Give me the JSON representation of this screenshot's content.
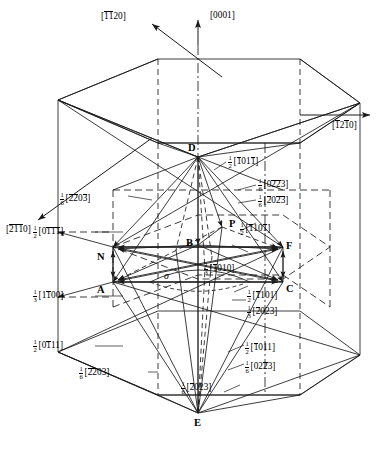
{
  "figure": {
    "title": "HCP lattice Burgers vector diagram",
    "type": "crystallographic-diagram",
    "line_color": "#1a1a1a",
    "background": "#ffffff"
  },
  "axes": [
    {
      "id": "axis-1120",
      "label": "[1̆1̆2 0]",
      "glyph": "[1120]",
      "bars": [
        1,
        1,
        0,
        0
      ],
      "digits": [
        "1",
        "1",
        "2",
        "0"
      ]
    },
    {
      "id": "axis-0001",
      "label": "[0001]",
      "glyph": "[0001]",
      "bars": [
        0,
        0,
        0,
        0
      ],
      "digits": [
        "0",
        "0",
        "0",
        "1"
      ]
    },
    {
      "id": "axis-1210",
      "label": "[1210]",
      "glyph": "[1210]",
      "bars": [
        1,
        0,
        1,
        0
      ],
      "digits": [
        "1",
        "2",
        "1",
        "0"
      ]
    },
    {
      "id": "axis-2110",
      "label": "[2110]",
      "glyph": "[2110]",
      "bars": [
        1,
        1,
        1,
        0
      ],
      "digits": [
        "2",
        "1",
        "1",
        "0"
      ]
    }
  ],
  "vertices": [
    {
      "name": "D"
    },
    {
      "name": "P"
    },
    {
      "name": "B"
    },
    {
      "name": "N"
    },
    {
      "name": "F"
    },
    {
      "name": "A"
    },
    {
      "name": "C"
    },
    {
      "name": "E"
    }
  ],
  "sigma_symbol": "σ",
  "vectors": [
    {
      "id": "v-half-1011-bar",
      "frac_num": "1",
      "frac_den": "2",
      "digits": [
        "1",
        "0",
        "1",
        "1"
      ],
      "bars": [
        1,
        0,
        0,
        1
      ]
    },
    {
      "id": "v-sixth-0223-bar",
      "frac_num": "1",
      "frac_den": "6",
      "digits": [
        "0",
        "2",
        "2",
        "3"
      ],
      "bars": [
        0,
        0,
        1,
        1
      ]
    },
    {
      "id": "v-sixth-2023-bar",
      "frac_num": "1",
      "frac_den": "6",
      "digits": [
        "2",
        "0",
        "2",
        "3"
      ],
      "bars": [
        1,
        0,
        1,
        1
      ]
    },
    {
      "id": "v-half-1101-bar",
      "frac_num": "1",
      "frac_den": "2",
      "digits": [
        "1",
        "1",
        "0",
        "1"
      ],
      "bars": [
        1,
        0,
        0,
        1
      ]
    },
    {
      "id": "v-sixth-2203-bar",
      "frac_num": "1",
      "frac_den": "6",
      "digits": [
        "2",
        "2",
        "0",
        "3"
      ],
      "bars": [
        1,
        1,
        0,
        1
      ]
    },
    {
      "id": "v-half-0111-bar",
      "frac_num": "1",
      "frac_den": "2",
      "digits": [
        "0",
        "1",
        "1",
        "1"
      ],
      "bars": [
        0,
        1,
        1,
        1
      ]
    },
    {
      "id": "v-third-1100",
      "frac_num": "1",
      "frac_den": "3",
      "digits": [
        "1",
        "1",
        "0",
        "0"
      ],
      "bars": [
        0,
        1,
        0,
        0
      ]
    },
    {
      "id": "v-half-0111",
      "frac_num": "1",
      "frac_den": "2",
      "digits": [
        "0",
        "1",
        "1",
        "1"
      ],
      "bars": [
        0,
        1,
        0,
        0
      ]
    },
    {
      "id": "v-sixth-2203",
      "frac_num": "1",
      "frac_den": "6",
      "digits": [
        "2",
        "2",
        "0",
        "3"
      ],
      "bars": [
        1,
        1,
        0,
        0
      ]
    },
    {
      "id": "v-third-1010",
      "frac_num": "1",
      "frac_den": "3",
      "digits": [
        "1",
        "0",
        "1",
        "0"
      ],
      "bars": [
        1,
        0,
        0,
        0
      ]
    },
    {
      "id": "v-half-1101",
      "frac_num": "1",
      "frac_den": "2",
      "digits": [
        "1",
        "1",
        "0",
        "1"
      ],
      "bars": [
        1,
        0,
        0,
        0
      ]
    },
    {
      "id": "v-third-2023",
      "frac_num": "1",
      "frac_den": "3",
      "digits": [
        "2",
        "0",
        "2",
        "3"
      ],
      "bars": [
        1,
        0,
        0,
        0
      ]
    },
    {
      "id": "v-half-1011",
      "frac_num": "1",
      "frac_den": "2",
      "digits": [
        "1",
        "0",
        "1",
        "1"
      ],
      "bars": [
        1,
        0,
        0,
        0
      ]
    },
    {
      "id": "v-sixth-0223",
      "frac_num": "1",
      "frac_den": "6",
      "digits": [
        "0",
        "2",
        "2",
        "3"
      ],
      "bars": [
        0,
        0,
        1,
        0
      ]
    },
    {
      "id": "v-sixth-2023",
      "frac_num": "1",
      "frac_den": "6",
      "digits": [
        "2",
        "0",
        "2",
        "3"
      ],
      "bars": [
        1,
        0,
        0,
        0
      ]
    }
  ]
}
